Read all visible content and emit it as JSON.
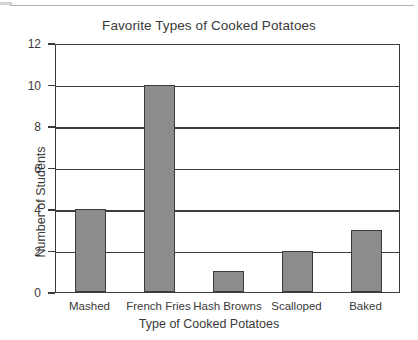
{
  "chart_data": {
    "type": "bar",
    "title": "Favorite Types of Cooked Potatoes",
    "xlabel": "Type of Cooked Potatoes",
    "ylabel": "Number of Students",
    "categories": [
      "Mashed",
      "French Fries",
      "Hash Browns",
      "Scalloped",
      "Baked"
    ],
    "values": [
      4,
      10,
      1,
      2,
      3
    ],
    "ylim": [
      0,
      12
    ],
    "ytick_labels": [
      "0",
      "2",
      "4",
      "6",
      "8",
      "10",
      "12"
    ],
    "ytick_values": [
      0,
      2,
      4,
      6,
      8,
      10,
      12
    ],
    "grid": "horizontal",
    "legend": "none",
    "bar_fill_color": "#8c8c8c",
    "bar_edge_color": "#3b3b3b",
    "axis_color": "#3b3b3b",
    "background_color": "#ffffff"
  }
}
